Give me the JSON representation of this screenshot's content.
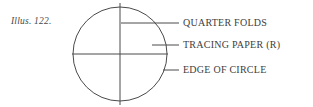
{
  "figure": {
    "caption": "Illus. 122.",
    "background_color": "#ffffff",
    "ink_color": "#4a4a4a",
    "text_color": "#3d3d3d"
  },
  "diagram": {
    "type": "line-drawing",
    "circle": {
      "center_x": 120,
      "center_y": 54,
      "radius": 47,
      "stroke_color": "#4a4a4a",
      "stroke_width": 1
    },
    "fold_lines": [
      {
        "name": "vertical-fold",
        "x1": 120,
        "y1": 3,
        "x2": 120,
        "y2": 105
      },
      {
        "name": "horizontal-fold",
        "x1": 72,
        "y1": 54,
        "x2": 168,
        "y2": 54
      }
    ]
  },
  "callouts": [
    {
      "id": "quarter-folds",
      "label": "QUARTER FOLDS",
      "leader": {
        "x1": 121,
        "y1": 23,
        "x2": 179,
        "y2": 23
      }
    },
    {
      "id": "tracing-paper",
      "label": "TRACING PAPER (R)",
      "leader": {
        "x1": 152,
        "y1": 45,
        "x2": 179,
        "y2": 45
      }
    },
    {
      "id": "edge-of-circle",
      "label": "EDGE OF CIRCLE",
      "leader": {
        "x1": 163,
        "y1": 70,
        "x2": 179,
        "y2": 70
      }
    }
  ]
}
